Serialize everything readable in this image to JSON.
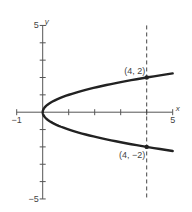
{
  "chart_data": {
    "type": "line",
    "title": "",
    "xlabel": "x",
    "ylabel": "y",
    "xlim": [
      -1,
      5
    ],
    "ylim": [
      -5,
      5
    ],
    "grid": false,
    "x_tick_values": [
      -1,
      1,
      2,
      3,
      4,
      5
    ],
    "y_tick_values": [
      -5,
      -4,
      -3,
      -2,
      -1,
      1,
      2,
      3,
      4,
      5
    ],
    "x_tick_labels": [
      {
        "value": -1,
        "label": "−1"
      },
      {
        "value": 5,
        "label": "5"
      }
    ],
    "y_tick_labels": [
      {
        "value": 5,
        "label": "5"
      },
      {
        "value": -5,
        "label": "−5"
      }
    ],
    "series": [
      {
        "name": "x = y^2",
        "equation": "x = y^2",
        "y_range": [
          -2.236,
          2.236
        ],
        "color": "#222222"
      }
    ],
    "vertical_line": {
      "x": 4,
      "style": "dashed",
      "y_range": [
        -5,
        5
      ]
    },
    "points": [
      {
        "x": 4,
        "y": 2,
        "label": "(4, 2)",
        "label_position": "above-left"
      },
      {
        "x": 4,
        "y": -2,
        "label": "(4, −2)",
        "label_position": "below-left"
      }
    ]
  }
}
